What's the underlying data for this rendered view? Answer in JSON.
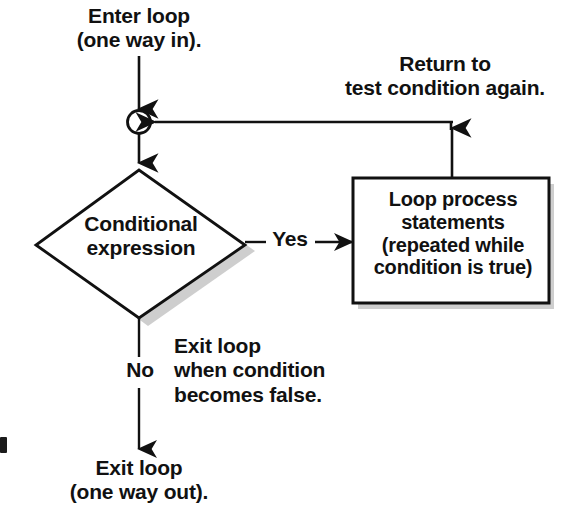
{
  "diagram": {
    "background_color": "#ffffff",
    "stroke_color": "#111111",
    "shadow_color": "#b8b8b8",
    "nodes": {
      "entry_connector": {
        "shape": "circle",
        "label": ""
      },
      "decision": {
        "shape": "diamond",
        "text": "Conditional\nexpression"
      },
      "process": {
        "shape": "rectangle",
        "text": "Loop process\nstatements\n(repeated while\ncondition is true)"
      }
    },
    "annotations": {
      "enter_loop": "Enter loop\n(one way in).",
      "return_to_test": "Return to\ntest condition again.",
      "exit_when_false": "Exit loop\nwhen condition\nbecomes false.",
      "exit_loop_out": "Exit loop\n(one way out)."
    },
    "edge_labels": {
      "yes": "Yes",
      "no": "No"
    }
  }
}
